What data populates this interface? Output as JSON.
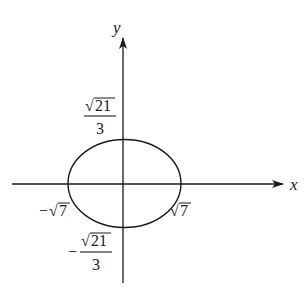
{
  "figure": {
    "type": "ellipse-graph",
    "axes": {
      "x_label": "x",
      "y_label": "y"
    },
    "intercepts": {
      "x_negative": {
        "sign": "−",
        "radical": "√",
        "radicand": "7"
      },
      "x_positive": {
        "radical": "√",
        "radicand": "7"
      },
      "y_positive": {
        "radical": "√",
        "radicand": "21",
        "denominator": "3"
      },
      "y_negative": {
        "sign": "−",
        "radical": "√",
        "radicand": "21",
        "denominator": "3"
      }
    },
    "colors": {
      "stroke": "#1a1a1a",
      "background": "#ffffff"
    }
  }
}
